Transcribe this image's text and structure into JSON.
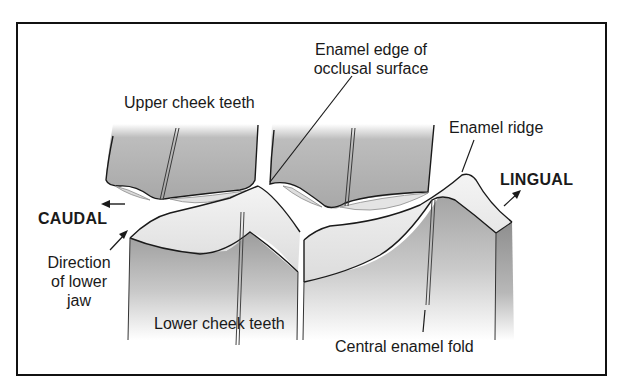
{
  "figure": {
    "type": "anatomical diagram",
    "colors": {
      "border": "#111111",
      "tooth_shade": "#a9a9a9",
      "tooth_light": "#e8e8e8",
      "occlusal_surface": "#eeeeee",
      "outline": "#1a1a1a",
      "background": "#ffffff"
    }
  },
  "labels": {
    "enamel_edge_line1": "Enamel edge of",
    "enamel_edge_line2": "occlusal surface",
    "upper_cheek_teeth": "Upper cheek teeth",
    "enamel_ridge": "Enamel ridge",
    "lingual": "LINGUAL",
    "caudal": "CAUDAL",
    "direction_line1": "Direction",
    "direction_line2": "of lower",
    "direction_line3": "jaw",
    "lower_cheek_teeth": "Lower cheek teeth",
    "central_enamel_fold": "Central enamel fold"
  },
  "icons": {
    "caudal_arrow": "arrow-left",
    "lingual_arrow": "arrow-up-right",
    "direction_arrow": "arrow-up-right"
  }
}
